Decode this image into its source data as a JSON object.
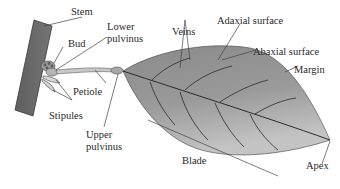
{
  "diagram": {
    "labels": {
      "stem": "Stem",
      "bud": "Bud",
      "lower_pulvinus_1": "Lower",
      "lower_pulvinus_2": "pulvinus",
      "veins": "Veins",
      "adaxial": "Adaxial surface",
      "abaxial": "Abaxial surface",
      "margin": "Margin",
      "petiole": "Petiole",
      "stipules": "Stipules",
      "upper_pulvinus_1": "Upper",
      "upper_pulvinus_2": "pulvinus",
      "blade": "Blade",
      "apex": "Apex"
    },
    "colors": {
      "stem": "#6b6b6b",
      "leaf_dark": "#7a7a7a",
      "leaf_light": "#a9a9a9",
      "vein": "#2b2b2b",
      "text": "#2a2a2a",
      "leader": "#444444"
    }
  }
}
